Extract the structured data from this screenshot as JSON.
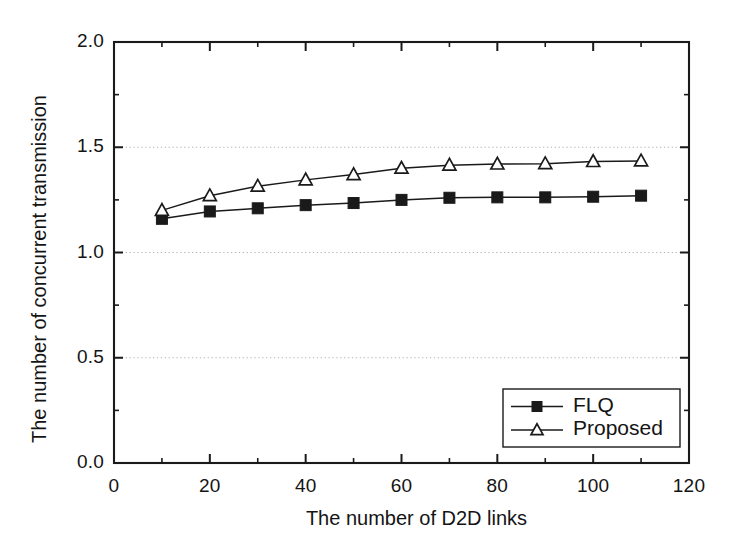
{
  "chart_data": {
    "type": "line",
    "title": "",
    "xlabel": "The number of  D2D links",
    "ylabel": "The number of concurrent transmission",
    "x": [
      10,
      20,
      30,
      40,
      50,
      60,
      70,
      80,
      90,
      100,
      110
    ],
    "series": [
      {
        "name": "FLQ",
        "marker": "filled-square",
        "values": [
          1.16,
          1.195,
          1.21,
          1.225,
          1.235,
          1.25,
          1.26,
          1.262,
          1.262,
          1.265,
          1.27
        ]
      },
      {
        "name": "Proposed",
        "marker": "open-triangle",
        "values": [
          1.2,
          1.27,
          1.315,
          1.345,
          1.37,
          1.4,
          1.415,
          1.42,
          1.422,
          1.432,
          1.435
        ]
      }
    ],
    "xlim": [
      0,
      120
    ],
    "ylim": [
      0.0,
      2.0
    ],
    "xticks": [
      0,
      20,
      40,
      60,
      80,
      100,
      120
    ],
    "xtick_labels": [
      "0",
      "20",
      "40",
      "60",
      "80",
      "100",
      "120"
    ],
    "yticks": [
      0.0,
      0.5,
      1.0,
      1.5,
      2.0
    ],
    "ytick_labels": [
      "0.0",
      "0.5",
      "1.0",
      "1.5",
      "2.0"
    ],
    "x_minor_step": 10,
    "y_minor_step": 0.25,
    "grid": "horizontal-dotted-at-major-y",
    "legend": {
      "position": "lower-right-inside",
      "entries": [
        "FLQ",
        "Proposed"
      ]
    },
    "colors": {
      "axis": "#1a1a1a",
      "grid": "#b4b4b4",
      "series_flq": "#1a1a1a",
      "series_proposed": "#1a1a1a",
      "background": "#ffffff"
    }
  }
}
